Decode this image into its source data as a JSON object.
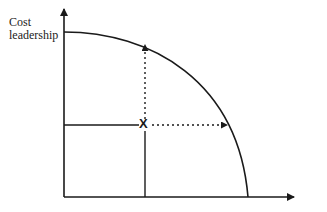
{
  "diagram": {
    "type": "production-possibility-frontier",
    "y_axis_label_line1": "Cost",
    "y_axis_label_line2": "leadership",
    "x_axis_label": "",
    "point_marker": "X",
    "colors": {
      "line": "#1a1a1a",
      "background": "#ffffff"
    },
    "geometry": {
      "origin": [
        64,
        197
      ],
      "y_axis_top": 8,
      "x_axis_end": 296,
      "curve_start": [
        64,
        32
      ],
      "curve_end": [
        248,
        197
      ],
      "point": [
        145,
        125
      ],
      "curve_top_intersection": [
        145,
        44
      ],
      "curve_right_intersection": [
        228,
        125
      ]
    }
  }
}
